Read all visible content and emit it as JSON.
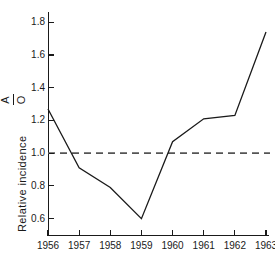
{
  "chart_data": {
    "type": "line",
    "title": "",
    "subtitle": "",
    "xlabel": "",
    "ylabel": "Relative incidence",
    "ylabel_ratio_numerator": "A",
    "ylabel_ratio_denominator": "O",
    "categories": [
      "1956",
      "1957",
      "1958",
      "1959",
      "1960",
      "1961",
      "1962",
      "1963"
    ],
    "x": [
      1956,
      1957,
      1958,
      1959,
      1960,
      1961,
      1962,
      1963
    ],
    "values": [
      1.27,
      0.91,
      0.79,
      0.6,
      1.07,
      1.21,
      1.23,
      1.74
    ],
    "series": [
      {
        "name": "Relative incidence A/O",
        "values": [
          1.27,
          0.91,
          0.79,
          0.6,
          1.07,
          1.21,
          1.23,
          1.74
        ],
        "color": "#1a1a1a",
        "style": "solid"
      }
    ],
    "reference_line": {
      "name": "unity reference",
      "value": 1.0,
      "orientation": "horizontal",
      "style": "dashed",
      "color": "#555555"
    },
    "ylim": [
      0.5,
      1.85
    ],
    "xlim": [
      1956,
      1963
    ],
    "ytick_labels": [
      "1.8",
      "1.6",
      "1.4",
      "1.2",
      "1.0",
      "0.8",
      "0.6"
    ],
    "ytick_values": [
      1.8,
      1.6,
      1.4,
      1.2,
      1.0,
      0.8,
      0.6
    ],
    "ytick_step": 0.2,
    "xtick_labels": [
      "1956",
      "1957",
      "1958",
      "1959",
      "1960",
      "1961",
      "1962",
      "1963"
    ],
    "grid": false,
    "legend": false,
    "legend_position": "none",
    "background_color": "#ffffff",
    "axis_color": "#1a1a1a"
  }
}
